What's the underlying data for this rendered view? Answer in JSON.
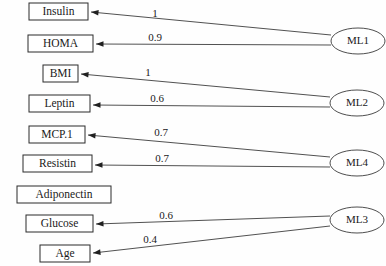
{
  "diagram": {
    "type": "directed-graph",
    "canvas": {
      "width": 386,
      "height": 266
    },
    "feature_nodes": [
      {
        "id": "insulin",
        "label": "Insulin",
        "x": 29,
        "y": 3,
        "w": 59,
        "h": 17
      },
      {
        "id": "homa",
        "label": "HOMA",
        "x": 28,
        "y": 35,
        "w": 65,
        "h": 17
      },
      {
        "id": "bmi",
        "label": "BMI",
        "x": 43,
        "y": 65,
        "w": 35,
        "h": 17
      },
      {
        "id": "leptin",
        "label": "Leptin",
        "x": 29,
        "y": 95,
        "w": 61,
        "h": 17
      },
      {
        "id": "mcp1",
        "label": "MCP.1",
        "x": 29,
        "y": 126,
        "w": 56,
        "h": 17
      },
      {
        "id": "resistin",
        "label": "Resistin",
        "x": 23,
        "y": 155,
        "w": 69,
        "h": 17
      },
      {
        "id": "adiponectin",
        "label": "Adiponectin",
        "x": 17,
        "y": 186,
        "w": 94,
        "h": 17
      },
      {
        "id": "glucose",
        "label": "Glucose",
        "x": 26,
        "y": 215,
        "w": 67,
        "h": 17
      },
      {
        "id": "age",
        "label": "Age",
        "x": 40,
        "y": 245,
        "w": 50,
        "h": 17
      }
    ],
    "model_nodes": [
      {
        "id": "ml1",
        "label": "ML1",
        "cx": 358,
        "cy": 41,
        "rx": 27,
        "ry": 13
      },
      {
        "id": "ml2",
        "label": "ML2",
        "cx": 357,
        "cy": 103,
        "rx": 27,
        "ry": 13
      },
      {
        "id": "ml4",
        "label": "ML4",
        "cx": 357,
        "cy": 163,
        "rx": 27,
        "ry": 13
      },
      {
        "id": "ml3",
        "label": "ML3",
        "cx": 357,
        "cy": 220,
        "rx": 27,
        "ry": 13
      }
    ],
    "edges": [
      {
        "id": "ml1-insulin",
        "from": "ml1",
        "to": "insulin",
        "weight": "1",
        "x1": 331,
        "y1": 35,
        "x2": 91,
        "y2": 12,
        "lx": 155,
        "ly": 14
      },
      {
        "id": "ml1-homa",
        "from": "ml1",
        "to": "homa",
        "weight": "0.9",
        "x1": 331,
        "y1": 45,
        "x2": 96,
        "y2": 44,
        "lx": 155,
        "ly": 38
      },
      {
        "id": "ml2-bmi",
        "from": "ml2",
        "to": "bmi",
        "weight": "1",
        "x1": 330,
        "y1": 97,
        "x2": 81,
        "y2": 74,
        "lx": 148,
        "ly": 73
      },
      {
        "id": "ml2-leptin",
        "from": "ml2",
        "to": "leptin",
        "weight": "0.6",
        "x1": 330,
        "y1": 107,
        "x2": 93,
        "y2": 105,
        "lx": 157,
        "ly": 99
      },
      {
        "id": "ml4-mcp1",
        "from": "ml4",
        "to": "mcp1",
        "weight": "0.7",
        "x1": 330,
        "y1": 157,
        "x2": 88,
        "y2": 135,
        "lx": 161,
        "ly": 133
      },
      {
        "id": "ml4-resistin",
        "from": "ml4",
        "to": "resistin",
        "weight": "0.7",
        "x1": 330,
        "y1": 167,
        "x2": 95,
        "y2": 165,
        "lx": 162,
        "ly": 159
      },
      {
        "id": "ml3-glucose",
        "from": "ml3",
        "to": "glucose",
        "weight": "0.6",
        "x1": 330,
        "y1": 216,
        "x2": 96,
        "y2": 224,
        "lx": 166,
        "ly": 216
      },
      {
        "id": "ml3-age",
        "from": "ml3",
        "to": "age",
        "weight": "0.4",
        "x1": 330,
        "y1": 226,
        "x2": 93,
        "y2": 253,
        "lx": 150,
        "ly": 240
      }
    ]
  }
}
